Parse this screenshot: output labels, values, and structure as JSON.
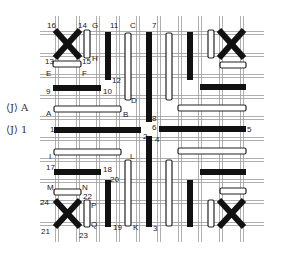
{
  "diagram": {
    "type": "bar-crossing-grid",
    "side_labels": [
      {
        "id": "JA",
        "text": "⟨J⟩ A",
        "x": 6,
        "y": 103
      },
      {
        "id": "J1",
        "text": "⟨J⟩ 1",
        "x": 6,
        "y": 125
      }
    ],
    "grid": {
      "color": "#9a9a9a",
      "h_lines": [
        33,
        55,
        76,
        97,
        118,
        139,
        160,
        181,
        202,
        224
      ],
      "h_x1": 40,
      "h_x2": 264,
      "v_lines": [
        57,
        78,
        98,
        118,
        138,
        159,
        180,
        200,
        221,
        242
      ],
      "v_y1": 16,
      "v_y2": 242
    },
    "bars": [
      {
        "id": "16-13",
        "kind": "cross",
        "x1": 55,
        "y1": 30,
        "x2": 80,
        "y2": 58
      },
      {
        "id": "14-13x",
        "kind": "cross",
        "x1": 80,
        "y1": 30,
        "x2": 55,
        "y2": 58
      },
      {
        "id": "GH",
        "kind": "white",
        "orient": "v",
        "x": 87,
        "y1": 30,
        "y2": 58
      },
      {
        "id": "EF",
        "kind": "white",
        "orient": "h",
        "y": 64,
        "x1": 53,
        "x2": 81
      },
      {
        "id": "11-12",
        "kind": "black",
        "orient": "v",
        "x": 108,
        "y1": 32,
        "y2": 80
      },
      {
        "id": "9-10",
        "kind": "black",
        "orient": "h",
        "y": 88,
        "x1": 53,
        "x2": 101
      },
      {
        "id": "CD",
        "kind": "white",
        "orient": "v",
        "x": 128,
        "y1": 33,
        "y2": 100
      },
      {
        "id": "AB",
        "kind": "white",
        "orient": "h",
        "y": 109,
        "x1": 54,
        "x2": 121
      },
      {
        "id": "7-8",
        "kind": "black",
        "orient": "v",
        "x": 149,
        "y1": 32,
        "y2": 122
      },
      {
        "id": "wv2",
        "kind": "white",
        "orient": "v",
        "x": 169,
        "y1": 33,
        "y2": 100
      },
      {
        "id": "bv2",
        "kind": "black",
        "orient": "v",
        "x": 190,
        "y1": 32,
        "y2": 80
      },
      {
        "id": "wv3",
        "kind": "white",
        "orient": "v",
        "x": 211,
        "y1": 30,
        "y2": 58
      },
      {
        "id": "crossTR1",
        "kind": "cross",
        "x1": 219,
        "y1": 30,
        "x2": 244,
        "y2": 58
      },
      {
        "id": "crossTR2",
        "kind": "cross",
        "x1": 244,
        "y1": 30,
        "x2": 219,
        "y2": 58
      },
      {
        "id": "wh2",
        "kind": "white",
        "orient": "h",
        "y": 65,
        "x1": 220,
        "x2": 246
      },
      {
        "id": "bh2",
        "kind": "black",
        "orient": "h",
        "y": 87,
        "x1": 200,
        "x2": 246
      },
      {
        "id": "wh3",
        "kind": "white",
        "orient": "h",
        "y": 108,
        "x1": 178,
        "x2": 246
      },
      {
        "id": "6-5",
        "kind": "black",
        "orient": "h",
        "y": 129,
        "x1": 159,
        "x2": 246
      },
      {
        "id": "1-2",
        "kind": "black",
        "orient": "h",
        "y": 130,
        "x1": 54,
        "x2": 141
      },
      {
        "id": "2-3",
        "kind": "black",
        "orient": "v",
        "x": 149,
        "y1": 136,
        "y2": 227
      },
      {
        "id": "I-wh",
        "kind": "white",
        "orient": "h",
        "y": 152,
        "x1": 54,
        "x2": 121
      },
      {
        "id": "wh4",
        "kind": "white",
        "orient": "h",
        "y": 151,
        "x1": 178,
        "x2": 246
      },
      {
        "id": "17-18",
        "kind": "black",
        "orient": "h",
        "y": 172,
        "x1": 54,
        "x2": 101
      },
      {
        "id": "bh5",
        "kind": "black",
        "orient": "h",
        "y": 172,
        "x1": 200,
        "x2": 246
      },
      {
        "id": "LK",
        "kind": "white",
        "orient": "v",
        "x": 128,
        "y1": 160,
        "y2": 226
      },
      {
        "id": "wv5",
        "kind": "white",
        "orient": "v",
        "x": 169,
        "y1": 160,
        "y2": 226
      },
      {
        "id": "20-19",
        "kind": "black",
        "orient": "v",
        "x": 108,
        "y1": 180,
        "y2": 227
      },
      {
        "id": "bv5",
        "kind": "black",
        "orient": "v",
        "x": 190,
        "y1": 180,
        "y2": 227
      },
      {
        "id": "MN",
        "kind": "white",
        "orient": "h",
        "y": 192,
        "x1": 54,
        "x2": 81
      },
      {
        "id": "wh6",
        "kind": "white",
        "orient": "h",
        "y": 191,
        "x1": 220,
        "x2": 246
      },
      {
        "id": "PQ",
        "kind": "white",
        "orient": "v",
        "x": 87,
        "y1": 200,
        "y2": 227
      },
      {
        "id": "wv6",
        "kind": "white",
        "orient": "v",
        "x": 211,
        "y1": 200,
        "y2": 227
      },
      {
        "id": "crossBL1",
        "kind": "cross",
        "x1": 55,
        "y1": 200,
        "x2": 80,
        "y2": 227
      },
      {
        "id": "crossBL2",
        "kind": "cross",
        "x1": 80,
        "y1": 200,
        "x2": 55,
        "y2": 227
      },
      {
        "id": "crossBR1",
        "kind": "cross",
        "x1": 219,
        "y1": 200,
        "x2": 244,
        "y2": 227
      },
      {
        "id": "crossBR2",
        "kind": "cross",
        "x1": 244,
        "y1": 200,
        "x2": 219,
        "y2": 227
      }
    ],
    "labels": [
      {
        "t": "16",
        "x": 47,
        "y": 22
      },
      {
        "t": "14",
        "x": 78,
        "y": 22
      },
      {
        "t": "G",
        "x": 92,
        "y": 22
      },
      {
        "t": "11",
        "x": 110,
        "y": 22
      },
      {
        "t": "C",
        "x": 130,
        "y": 22
      },
      {
        "t": "7",
        "x": 152,
        "y": 22
      },
      {
        "t": "13",
        "x": 45,
        "y": 58
      },
      {
        "t": "15",
        "x": 82,
        "y": 58
      },
      {
        "t": "H",
        "x": 92,
        "y": 55
      },
      {
        "t": "E",
        "x": 46,
        "y": 70
      },
      {
        "t": "F",
        "x": 82,
        "y": 70
      },
      {
        "t": "12",
        "x": 112,
        "y": 77
      },
      {
        "t": "9",
        "x": 46,
        "y": 88
      },
      {
        "t": "10",
        "x": 103,
        "y": 88
      },
      {
        "t": "D",
        "x": 131,
        "y": 97
      },
      {
        "t": "A",
        "x": 46,
        "y": 110
      },
      {
        "t": "B",
        "x": 123,
        "y": 111
      },
      {
        "t": "8",
        "x": 152,
        "y": 115
      },
      {
        "t": "6",
        "x": 152,
        "y": 124
      },
      {
        "t": "5",
        "x": 247,
        "y": 126
      },
      {
        "t": "1",
        "x": 50,
        "y": 126
      },
      {
        "t": "2",
        "x": 143,
        "y": 133
      },
      {
        "t": "4",
        "x": 155,
        "y": 136
      },
      {
        "t": "I",
        "x": 49,
        "y": 153
      },
      {
        "t": "17",
        "x": 46,
        "y": 164
      },
      {
        "t": "18",
        "x": 103,
        "y": 166
      },
      {
        "t": "L",
        "x": 130,
        "y": 153
      },
      {
        "t": "20",
        "x": 110,
        "y": 176
      },
      {
        "t": "M",
        "x": 47,
        "y": 184
      },
      {
        "t": "N",
        "x": 82,
        "y": 184
      },
      {
        "t": "22",
        "x": 83,
        "y": 193
      },
      {
        "t": "24",
        "x": 40,
        "y": 199
      },
      {
        "t": "P",
        "x": 91,
        "y": 202
      },
      {
        "t": "21",
        "x": 41,
        "y": 228
      },
      {
        "t": "Q",
        "x": 91,
        "y": 221
      },
      {
        "t": "19",
        "x": 113,
        "y": 224
      },
      {
        "t": "K",
        "x": 133,
        "y": 224
      },
      {
        "t": "3",
        "x": 153,
        "y": 225
      },
      {
        "t": "23",
        "x": 79,
        "y": 232
      }
    ],
    "colors": {
      "black_bar": "#111111",
      "white_bar_fill": "#ffffff",
      "white_bar_stroke": "#222222",
      "cross": "#111111"
    }
  }
}
